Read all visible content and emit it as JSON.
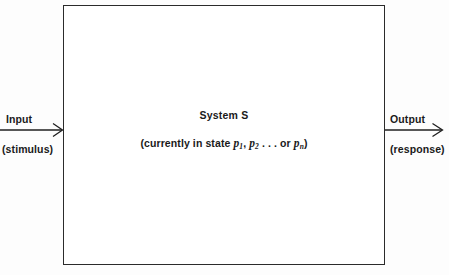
{
  "diagram": {
    "box": {
      "label_primary": "System S",
      "state_prefix": "(currently in state",
      "state_symbol_1": "p",
      "state_subscript_1": "1",
      "state_sep_1": ",",
      "state_symbol_2": "p",
      "state_subscript_2": "2",
      "state_ellipsis": ". . . or",
      "state_symbol_n": "p",
      "state_subscript_n": "n",
      "state_suffix": ")"
    },
    "input": {
      "label": "Input",
      "sublabel": "(stimulus)",
      "arrow_direction": "right"
    },
    "output": {
      "label": "Output",
      "sublabel": "(response)",
      "arrow_direction": "right"
    },
    "colors": {
      "stroke": "#2b2b2b",
      "background": "#fdfdfd",
      "box_fill": "#ffffff",
      "text": "#1a1a1a"
    }
  }
}
